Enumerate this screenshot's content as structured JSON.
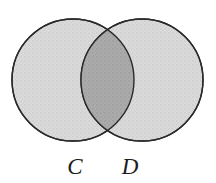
{
  "figure": {
    "kind": "venn-diagram",
    "canvas": {
      "width": 216,
      "height": 183,
      "background_color": "#ffffff"
    },
    "colors": {
      "circle_fill": "#d9d9d9",
      "intersection_fill": "#a9a9a9",
      "stroke": "#2a2a2a",
      "label_color": "#1c1c1c"
    },
    "stroke_width": 1.4,
    "sets": [
      {
        "id": "c",
        "label": "C",
        "center_x": 73,
        "center_y": 80,
        "radius": 61,
        "label_x": 75,
        "label_y": 175
      },
      {
        "id": "d",
        "label": "D",
        "center_x": 142,
        "center_y": 80,
        "radius": 61,
        "label_x": 130,
        "label_y": 175
      }
    ],
    "intersection": {
      "id": "c-and-d",
      "shaded": true,
      "top_crossing_x": 107.5,
      "top_crossing_y": 25.6,
      "bottom_crossing_x": 107.5,
      "bottom_crossing_y": 134.4
    }
  }
}
